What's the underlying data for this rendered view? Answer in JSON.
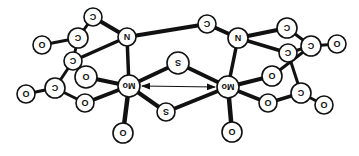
{
  "diagram": {
    "orientation": "rotated-180",
    "colors": {
      "bond": "#111111",
      "atom_fill": "#ffffff",
      "atom_stroke": "#111111"
    },
    "atoms": [
      {
        "id": "C1",
        "label": "C",
        "x": 93,
        "y": 17,
        "r": 9
      },
      {
        "id": "N1",
        "label": "N",
        "x": 127,
        "y": 37,
        "r": 9
      },
      {
        "id": "C2",
        "label": "C",
        "x": 78,
        "y": 38,
        "r": 10
      },
      {
        "id": "O1",
        "label": "O",
        "x": 42,
        "y": 45,
        "r": 9
      },
      {
        "id": "C3",
        "label": "C",
        "x": 73,
        "y": 61,
        "r": 9
      },
      {
        "id": "O2",
        "label": "O",
        "x": 86,
        "y": 77,
        "r": 11
      },
      {
        "id": "C4",
        "label": "C",
        "x": 55,
        "y": 88,
        "r": 10
      },
      {
        "id": "O3",
        "label": "O",
        "x": 26,
        "y": 94,
        "r": 9
      },
      {
        "id": "O4",
        "label": "O",
        "x": 85,
        "y": 103,
        "r": 9
      },
      {
        "id": "Mo1",
        "label": "Mo",
        "x": 129,
        "y": 86,
        "r": 11
      },
      {
        "id": "O5",
        "label": "O",
        "x": 123,
        "y": 133,
        "r": 10
      },
      {
        "id": "S1",
        "label": "S",
        "x": 178,
        "y": 63,
        "r": 11
      },
      {
        "id": "S2",
        "label": "S",
        "x": 166,
        "y": 112,
        "r": 9
      },
      {
        "id": "N2",
        "label": "N",
        "x": 238,
        "y": 38,
        "r": 10
      },
      {
        "id": "C5",
        "label": "C",
        "x": 207,
        "y": 24,
        "r": 9
      },
      {
        "id": "C6",
        "label": "C",
        "x": 287,
        "y": 28,
        "r": 10
      },
      {
        "id": "C7",
        "label": "C",
        "x": 288,
        "y": 53,
        "r": 9
      },
      {
        "id": "C8",
        "label": "C",
        "x": 311,
        "y": 46,
        "r": 10
      },
      {
        "id": "O6",
        "label": "O",
        "x": 337,
        "y": 44,
        "r": 9
      },
      {
        "id": "O7",
        "label": "O",
        "x": 272,
        "y": 76,
        "r": 10
      },
      {
        "id": "Mo2",
        "label": "Mo",
        "x": 228,
        "y": 87,
        "r": 11
      },
      {
        "id": "O8",
        "label": "O",
        "x": 268,
        "y": 103,
        "r": 9
      },
      {
        "id": "C9",
        "label": "C",
        "x": 301,
        "y": 93,
        "r": 10
      },
      {
        "id": "O9",
        "label": "O",
        "x": 324,
        "y": 105,
        "r": 9
      },
      {
        "id": "O10",
        "label": "O",
        "x": 232,
        "y": 132,
        "r": 10
      }
    ],
    "bonds": [
      [
        "C1",
        "N1",
        4
      ],
      [
        "C1",
        "C2",
        3
      ],
      [
        "N1",
        "C5",
        4
      ],
      [
        "N1",
        "C3",
        3.5
      ],
      [
        "N1",
        "Mo1",
        3.5
      ],
      [
        "C2",
        "O1",
        3
      ],
      [
        "C2",
        "C3",
        3
      ],
      [
        "C3",
        "O2",
        3
      ],
      [
        "C3",
        "C4",
        3
      ],
      [
        "C4",
        "O3",
        3
      ],
      [
        "C4",
        "O4",
        3
      ],
      [
        "O2",
        "Mo1",
        4
      ],
      [
        "O4",
        "Mo1",
        4
      ],
      [
        "Mo1",
        "O5",
        4.5
      ],
      [
        "Mo1",
        "S1",
        4
      ],
      [
        "Mo1",
        "S2",
        4
      ],
      [
        "S1",
        "Mo2",
        4
      ],
      [
        "S2",
        "Mo2",
        4
      ],
      [
        "C5",
        "N2",
        4
      ],
      [
        "N2",
        "C6",
        4
      ],
      [
        "N2",
        "C7",
        3.5
      ],
      [
        "N2",
        "Mo2",
        3.5
      ],
      [
        "C6",
        "C8",
        3
      ],
      [
        "C7",
        "C8",
        3
      ],
      [
        "C8",
        "O6",
        3
      ],
      [
        "C8",
        "O7",
        3
      ],
      [
        "C7",
        "C9",
        3
      ],
      [
        "O7",
        "Mo2",
        4
      ],
      [
        "O8",
        "Mo2",
        4
      ],
      [
        "O8",
        "C9",
        3.5
      ],
      [
        "C9",
        "O9",
        3
      ],
      [
        "Mo2",
        "O10",
        4.5
      ]
    ],
    "arrow": {
      "type": "double-headed",
      "from": "Mo1",
      "to": "Mo2",
      "x1": 142,
      "y1": 86,
      "x2": 215,
      "y2": 87
    }
  }
}
